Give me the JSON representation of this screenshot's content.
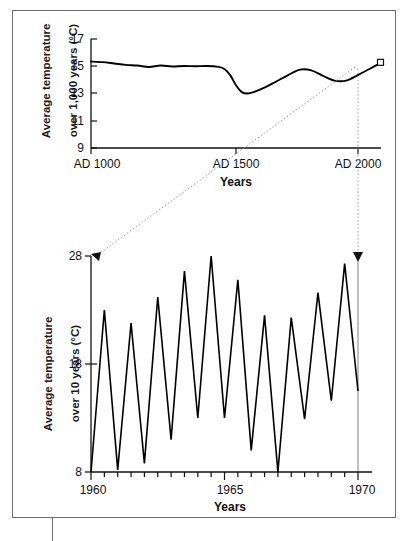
{
  "figure": {
    "background_color": "#ffffff",
    "frame_color": "#6d6d6d",
    "line_color": "#000000",
    "connector_color": "#9a9a9a"
  },
  "chart_data": [
    {
      "id": "millennium",
      "type": "line",
      "title": "",
      "xlabel": "Years",
      "ylabel": "Average temperature\nover 1,000 years (°C)",
      "ylabel_line1": "Average temperature",
      "ylabel_line2": "over 1,000 years (°C)",
      "xlim": [
        1000,
        2000
      ],
      "ylim": [
        9,
        17
      ],
      "xticks": [
        1000,
        1500,
        2000
      ],
      "xticklabels": [
        "AD 1000",
        "AD 1500",
        "AD 2000"
      ],
      "yticks": [
        9,
        11,
        13,
        15,
        17
      ],
      "yticklabels": [
        "9",
        "11",
        "13",
        "15",
        "17"
      ],
      "grid": false,
      "legend": "none",
      "marker_point": {
        "x": 2000,
        "y": 15.25,
        "shape": "square",
        "label": ""
      },
      "x": [
        1000,
        1040,
        1080,
        1120,
        1160,
        1200,
        1240,
        1280,
        1320,
        1360,
        1400,
        1440,
        1460,
        1480,
        1500,
        1520,
        1540,
        1560,
        1600,
        1640,
        1680,
        1720,
        1760,
        1800,
        1840,
        1880,
        1920,
        1960,
        2000
      ],
      "values": [
        15.35,
        15.3,
        15.2,
        15.1,
        15.05,
        14.95,
        15.05,
        14.98,
        15.02,
        15.0,
        15.02,
        14.95,
        14.8,
        14.35,
        13.6,
        13.1,
        13.0,
        13.1,
        13.45,
        13.9,
        14.35,
        14.75,
        14.7,
        14.3,
        13.95,
        13.95,
        14.35,
        14.8,
        15.25
      ]
    },
    {
      "id": "decade",
      "type": "line",
      "title": "",
      "xlabel": "Years",
      "ylabel": "Average temperature\nover 10 years (°C)",
      "ylabel_line1": "Average temperature",
      "ylabel_line2": "over 10 years (°C)",
      "xlim": [
        1960,
        1970
      ],
      "ylim": [
        8,
        28
      ],
      "xticks": [
        1960,
        1960.5,
        1961,
        1961.5,
        1962,
        1962.5,
        1963,
        1963.5,
        1964,
        1964.5,
        1965,
        1965.5,
        1966,
        1966.5,
        1967,
        1967.5,
        1968,
        1968.5,
        1969,
        1969.5,
        1970
      ],
      "xticklabels_shown": {
        "1960": "1960",
        "1965": "1965",
        "1970": "1970"
      },
      "yticks": [
        8,
        18,
        28
      ],
      "yticklabels": [
        "8",
        "18",
        "28"
      ],
      "grid": false,
      "legend": "none",
      "x": [
        1960.0,
        1960.5,
        1961.0,
        1961.5,
        1962.0,
        1962.5,
        1963.0,
        1963.5,
        1964.0,
        1964.5,
        1965.0,
        1965.5,
        1966.0,
        1966.5,
        1967.0,
        1967.5,
        1968.0,
        1968.5,
        1969.0,
        1969.5,
        1970.0
      ],
      "values": [
        8.0,
        23.0,
        8.2,
        21.8,
        8.8,
        24.2,
        11.0,
        26.6,
        13.0,
        28.0,
        13.0,
        25.8,
        10.0,
        22.5,
        8.0,
        22.3,
        12.9,
        24.6,
        14.6,
        27.3,
        15.5
      ]
    }
  ],
  "annotations": {
    "zoom_connector_left": "dotted diagonal line from top chart AD 2000 marker to lower chart upper-left",
    "zoom_connector_right": "dotted vertical line from top chart AD 2000 tick to lower chart upper-right"
  }
}
